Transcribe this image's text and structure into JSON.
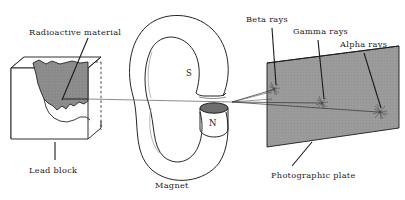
{
  "diagram": {
    "labels": {
      "radioactive_material": "Radioactive material",
      "lead_block": "Lead block",
      "magnet": "Magnet",
      "pole_south": "S",
      "pole_north": "N",
      "beta_rays": "Beta rays",
      "gamma_rays": "Gamma rays",
      "alpha_rays": "Alpha rays",
      "photographic_plate": "Photographic plate"
    },
    "colors": {
      "stroke": "#1a1a1a",
      "material_fill": "#8c8c8c",
      "plate_fill": "#9a9a9a",
      "pole_fill": "#6e6e6e",
      "block_face": "#ffffff",
      "background": "#ffffff"
    },
    "rays": {
      "count": 3,
      "order_on_plate": [
        "Beta rays",
        "Gamma rays",
        "Alpha rays"
      ],
      "origin": "magnet gap",
      "deflection": {
        "Beta rays": "deflected upward (most)",
        "Gamma rays": "undeflected (straight)",
        "Alpha rays": "deflected downward (least)"
      }
    },
    "impact_spots": 3
  }
}
